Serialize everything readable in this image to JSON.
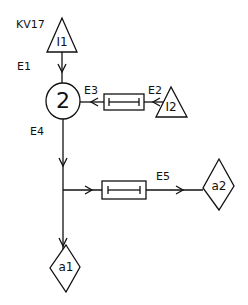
{
  "diagram": {
    "title_label": "KV17",
    "edges": {
      "e1": "E1",
      "e2": "E2",
      "e3": "E3",
      "e4": "E4",
      "e5": "E5"
    },
    "nodes": {
      "input1": "I1",
      "input2": "I2",
      "process": "2",
      "output1": "a1",
      "output2": "a2"
    },
    "components": [
      {
        "id": "box-e2-e3",
        "type": "rectangle-element"
      },
      {
        "id": "box-e5",
        "type": "rectangle-element"
      }
    ],
    "colors": {
      "line": "#111111",
      "background": "#ffffff"
    }
  }
}
